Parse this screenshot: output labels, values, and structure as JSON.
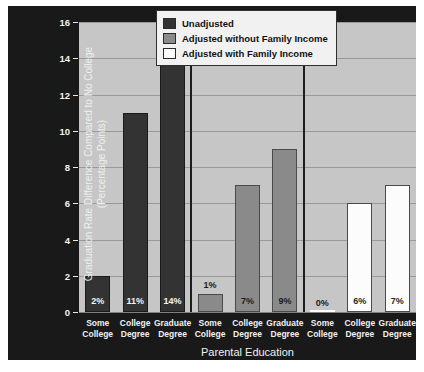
{
  "chart_data": {
    "type": "bar",
    "title": "",
    "xlabel": "Parental Education",
    "ylabel": "Graduation Rate Difference Compared to No College (Percentage Points)",
    "ylabel_line1": "Graduation Rate Difference Compared to No College",
    "ylabel_line2": "(Percentage Points)",
    "ylim": [
      0,
      16
    ],
    "yticks": [
      0,
      2,
      4,
      6,
      8,
      10,
      12,
      14,
      16
    ],
    "ytick_labels": [
      "0",
      "2",
      "4",
      "6",
      "8",
      "10",
      "12",
      "14",
      "16"
    ],
    "grid": true,
    "legend_position": "top-right",
    "categories": [
      "Some College",
      "College Degree",
      "Graduate Degree"
    ],
    "category_lines": [
      [
        "Some",
        "College"
      ],
      [
        "College",
        "Degree"
      ],
      [
        "Graduate",
        "Degree"
      ]
    ],
    "series": [
      {
        "name": "Unadjusted",
        "color": "#333333",
        "values": [
          2,
          11,
          14
        ],
        "labels": [
          "2%",
          "11%",
          "14%"
        ]
      },
      {
        "name": "Adjusted without Family Income",
        "color": "#8a8a8a",
        "values": [
          1,
          7,
          9
        ],
        "labels": [
          "1%",
          "7%",
          "9%"
        ]
      },
      {
        "name": "Adjusted with Family Income",
        "color": "#fcfcfc",
        "values": [
          0,
          6,
          7
        ],
        "labels": [
          "0%",
          "6%",
          "7%"
        ]
      }
    ]
  },
  "legend": {
    "items": [
      {
        "label": "Unadjusted",
        "color": "#333333"
      },
      {
        "label": "Adjusted without Family Income",
        "color": "#8a8a8a"
      },
      {
        "label": "Adjusted with Family Income",
        "color": "#fcfcfc"
      }
    ]
  },
  "colors": {
    "panel_background": "#191919",
    "plot_background": "#c6c6c6",
    "gridline": "#9a9a9a",
    "text_light": "#f0f0f0",
    "divider": "#1d1d1d"
  }
}
